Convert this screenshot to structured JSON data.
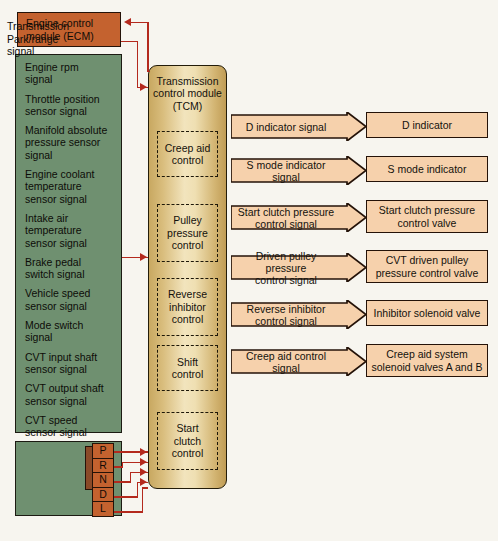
{
  "diagram": {
    "colors": {
      "ecm_fill": "#c4622f",
      "sensor_fill": "#6f9070",
      "tcm_fill": "#e5cf96",
      "signal_fill": "#f6d1ac",
      "wire": "#b4291d",
      "outline": "#241208",
      "page_bg": "#f7f5ef"
    }
  },
  "ecm": {
    "line1": "Engine control",
    "line2": "module (ECM)"
  },
  "sensor_inputs": {
    "items": [
      "Engine rpm\nsignal",
      "Throttle position\nsensor signal",
      "Manifold absolute\npressure sensor\nsignal",
      "Engine coolant\ntemperature\nsensor signal",
      "Intake air\ntemperature\nsensor signal",
      "Brake pedal\nswitch signal",
      "Vehicle speed\nsensor signal",
      "Mode switch\nsignal",
      "CVT input shaft\nsensor signal",
      "CVT output shaft\nsensor signal",
      "CVT speed\nsensor signal"
    ]
  },
  "park_range": {
    "label": "Transmission\nPark/range\nsignal",
    "gears": [
      "P",
      "R",
      "N",
      "D",
      "L"
    ]
  },
  "tcm": {
    "title": "Transmission\ncontrol module\n(TCM)",
    "sub_controls": [
      {
        "label": "Creep aid\ncontrol"
      },
      {
        "label": "Pulley\npressure\ncontrol"
      },
      {
        "label": "Reverse\ninhibitor\ncontrol"
      },
      {
        "label": "Shift\ncontrol"
      },
      {
        "label": "Start\nclutch\ncontrol"
      }
    ]
  },
  "outputs": {
    "rows": [
      {
        "signal": "D indicator signal",
        "component": "D indicator"
      },
      {
        "signal": "S mode indicator signal",
        "component": "S mode indicator"
      },
      {
        "signal": "Start clutch pressure\ncontrol signal",
        "component": "Start clutch pressure\ncontrol valve"
      },
      {
        "signal": "Driven pulley pressure\ncontrol signal",
        "component": "CVT driven pulley\npressure control valve"
      },
      {
        "signal": "Reverse inhibitor\ncontrol signal",
        "component": "Inhibitor solenoid valve"
      },
      {
        "signal": "Creep aid control signal",
        "component": "Creep aid system\nsolenoid valves A and B"
      }
    ]
  }
}
